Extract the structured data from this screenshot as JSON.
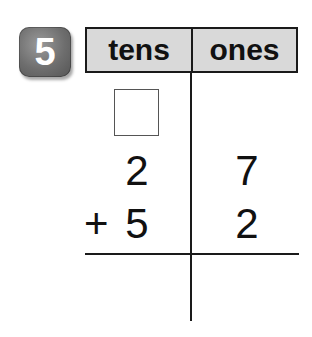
{
  "problem": {
    "number": "5",
    "badge_color": "#6e6e6e"
  },
  "table": {
    "headers": {
      "tens": "tens",
      "ones": "ones"
    },
    "header_bg": "#d9d9d9",
    "regroup_box": "",
    "rows": [
      {
        "tens": "2",
        "ones": "7"
      },
      {
        "operator": "+",
        "tens": "5",
        "ones": "2"
      }
    ],
    "answer": {
      "tens": "",
      "ones": ""
    }
  }
}
